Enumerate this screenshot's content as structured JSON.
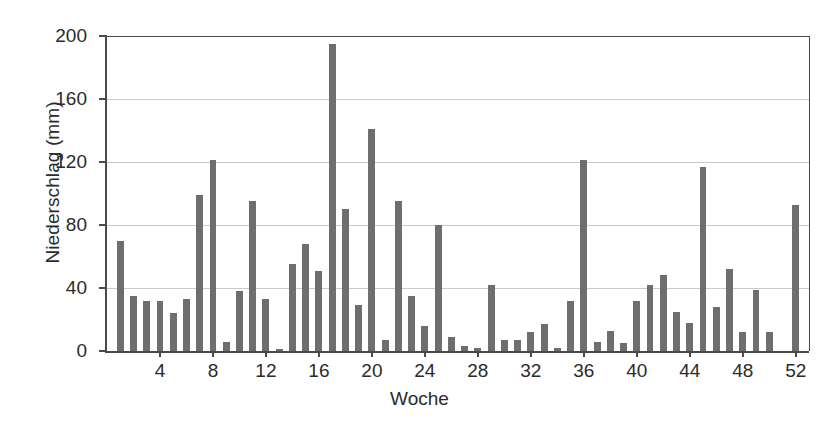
{
  "chart_data": {
    "type": "bar",
    "title": "",
    "xlabel": "Woche",
    "ylabel": "Niederschlag (mm)",
    "xlim": [
      0,
      53
    ],
    "ylim": [
      0,
      200
    ],
    "grid": true,
    "legend": null,
    "bar_color": "#6e6e6e",
    "axis_color": "#4a4a4a",
    "grid_color": "#c9c9c9",
    "ytick_labels": [
      "0",
      "40",
      "80",
      "120",
      "160",
      "200"
    ],
    "ytick_values": [
      0,
      40,
      80,
      120,
      160,
      200
    ],
    "xtick_labels": [
      "4",
      "8",
      "12",
      "16",
      "20",
      "24",
      "28",
      "32",
      "36",
      "40",
      "44",
      "48",
      "52"
    ],
    "xtick_values": [
      4,
      8,
      12,
      16,
      20,
      24,
      28,
      32,
      36,
      40,
      44,
      48,
      52
    ],
    "categories": [
      1,
      2,
      3,
      4,
      5,
      6,
      7,
      8,
      9,
      10,
      11,
      12,
      13,
      14,
      15,
      16,
      17,
      18,
      19,
      20,
      21,
      22,
      23,
      24,
      25,
      26,
      27,
      28,
      29,
      30,
      31,
      32,
      33,
      34,
      35,
      36,
      37,
      38,
      39,
      40,
      41,
      42,
      43,
      44,
      45,
      46,
      47,
      48,
      49,
      50,
      51,
      52
    ],
    "values": [
      70,
      35,
      32,
      32,
      24,
      33,
      99,
      121,
      6,
      38,
      95,
      33,
      1,
      55,
      68,
      51,
      195,
      90,
      29,
      141,
      7,
      95,
      35,
      16,
      80,
      9,
      3,
      2,
      42,
      7,
      7,
      12,
      17,
      2,
      32,
      121,
      6,
      13,
      5,
      32,
      42,
      48,
      25,
      18,
      117,
      28,
      52,
      12,
      39,
      12,
      0,
      93
    ]
  }
}
